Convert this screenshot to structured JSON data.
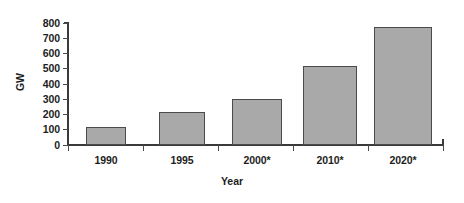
{
  "chart_data": {
    "type": "bar",
    "title": "",
    "subtitle": "",
    "categories": [
      "1990",
      "1995",
      "2000*",
      "2010*",
      "2020*"
    ],
    "values": [
      120,
      215,
      300,
      520,
      775
    ],
    "series": [
      {
        "name": "Installed capacity",
        "values": [
          120,
          215,
          300,
          520,
          775
        ]
      }
    ],
    "xlabel": "Year",
    "ylabel": "GW",
    "ylim": [
      0,
      800
    ],
    "ytick_values": [
      0,
      100,
      200,
      300,
      400,
      500,
      600,
      700,
      800
    ],
    "ytick_labels": [
      "0",
      "100",
      "200",
      "300",
      "400",
      "500",
      "600",
      "700",
      "800"
    ],
    "grid": false,
    "legend": false,
    "legend_position": "none",
    "bar_color": "#a9a9a9",
    "bar_edge_color": "#4b4b4b",
    "axis_color": "#3a3a3a",
    "background_color": "#ffffff",
    "annotations": []
  },
  "axis": {
    "y_title": "GW",
    "x_title": "Year"
  }
}
